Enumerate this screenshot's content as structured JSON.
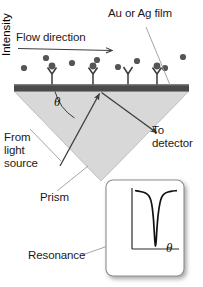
{
  "figure": {
    "background_color": "#ffffff",
    "width": 203,
    "height": 287
  },
  "labels": {
    "au_film": "Au or Ag film",
    "flow_direction": "Flow direction",
    "from_light_source": "From\nlight\nsource",
    "to_detector": "To\ndetector",
    "prism": "Prism",
    "resonance": "Resonance",
    "theta_symbol": "θ"
  },
  "colors": {
    "metal_film": "#4a4a4a",
    "prism_fill": "#d6d6d6",
    "prism_stroke": "#bdbdbd",
    "analyte_dot": "#555555",
    "receptor_stroke": "#3a3a3a",
    "ray_stroke": "#3d3d3d",
    "leader_stroke": "#9a9a9a",
    "text": "#1a1a1a",
    "inset_background": "#ffffff",
    "inset_border": "#8a8a8a",
    "inset_shadow": "#b9b9b9",
    "curve": "#111111"
  },
  "scene": {
    "metal_film": {
      "x": 14,
      "y": 84,
      "width": 175,
      "height": 7
    },
    "prism": {
      "apex_x": 101,
      "apex_y": 181,
      "left_x": 14,
      "right_x": 189,
      "top_y": 91
    },
    "flow_arrow": {
      "x1": 18,
      "y1": 49,
      "x2": 115,
      "y2": 51
    },
    "incident_ray": {
      "from": [
        60,
        165
      ],
      "to": [
        101,
        92
      ],
      "label": "from-light-source"
    },
    "reflected_ray": {
      "from": [
        101,
        92
      ],
      "to": [
        160,
        134
      ],
      "label": "to-detector"
    },
    "theta_arc": {
      "center": [
        101,
        90
      ],
      "radius": 46,
      "start_deg": 180,
      "end_deg": 240
    },
    "analyte_dots_free": [
      {
        "x": 24,
        "y": 68
      },
      {
        "x": 46,
        "y": 58
      },
      {
        "x": 72,
        "y": 63
      },
      {
        "x": 97,
        "y": 60
      },
      {
        "x": 118,
        "y": 67
      },
      {
        "x": 137,
        "y": 61
      },
      {
        "x": 165,
        "y": 68
      },
      {
        "x": 183,
        "y": 57
      }
    ],
    "receptors": [
      {
        "x": 52,
        "bound": true
      },
      {
        "x": 93,
        "bound": true
      },
      {
        "x": 128,
        "bound": false
      },
      {
        "x": 157,
        "bound": true
      }
    ],
    "leaders": [
      {
        "name": "au-film-leader",
        "from": [
          147,
          27
        ],
        "to": [
          170,
          86
        ]
      },
      {
        "name": "from-light-leader",
        "from": [
          32,
          128
        ],
        "to": [
          62,
          160
        ]
      },
      {
        "name": "prism-leader",
        "from": [
          58,
          190
        ],
        "to": [
          88,
          166
        ]
      },
      {
        "name": "resonance-leader",
        "from": [
          82,
          254
        ],
        "to": [
          150,
          230
        ]
      }
    ]
  },
  "chart_data": {
    "type": "line",
    "title": "",
    "xlabel": "θ",
    "ylabel": "Intensity",
    "grid": false,
    "legend": false,
    "xlim": [
      0,
      10
    ],
    "ylim": [
      0,
      10
    ],
    "annotation": "Resonance",
    "series": [
      {
        "name": "Reflected intensity vs angle",
        "x": [
          0.6,
          1.4,
          2.3,
          3.0,
          3.5,
          3.9,
          4.2,
          4.45,
          4.6,
          4.75,
          4.9,
          5.05,
          5.2,
          5.45,
          5.8,
          6.2,
          6.8,
          7.6,
          8.6,
          9.4
        ],
        "y": [
          9.4,
          9.3,
          9.15,
          8.9,
          8.5,
          7.8,
          6.6,
          4.8,
          3.0,
          1.3,
          0.5,
          1.4,
          3.2,
          5.4,
          7.2,
          8.3,
          8.9,
          9.2,
          9.35,
          9.4
        ]
      }
    ],
    "resonance_minimum": {
      "x": 4.9,
      "y": 0.5
    }
  },
  "inset": {
    "x": 104,
    "y": 178,
    "width": 84,
    "height": 102,
    "ylabel": "Intensity",
    "xlabel": "θ"
  }
}
